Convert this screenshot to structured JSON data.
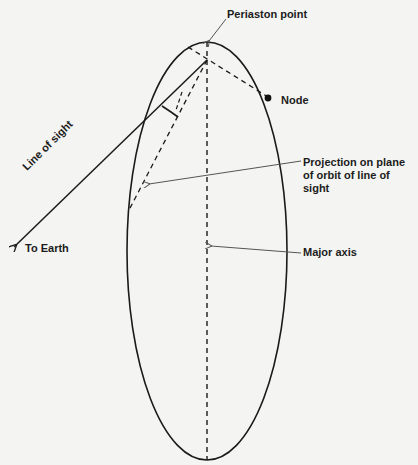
{
  "figure": {
    "type": "orbit-geometry-diagram"
  },
  "labels": {
    "periaston": "Periaston point",
    "node": "Node",
    "projection": "Projection on plane of orbit of line of sight",
    "major_axis": "Major axis",
    "line_of_sight": "Line of sight",
    "to_earth": "To Earth"
  },
  "elements": {
    "orbit": "elliptical orbit",
    "major_axis_line": "dashed",
    "focus_to_node_line": "dashed",
    "projection_line": "dashed",
    "line_of_sight_line": "solid with arrowhead",
    "right_angle_marker": "between line of sight and projection",
    "node_marker": "filled dot"
  },
  "colors": {
    "ink": "#1a1a1a",
    "leader": "#555555",
    "background": "#f4f4f2"
  }
}
